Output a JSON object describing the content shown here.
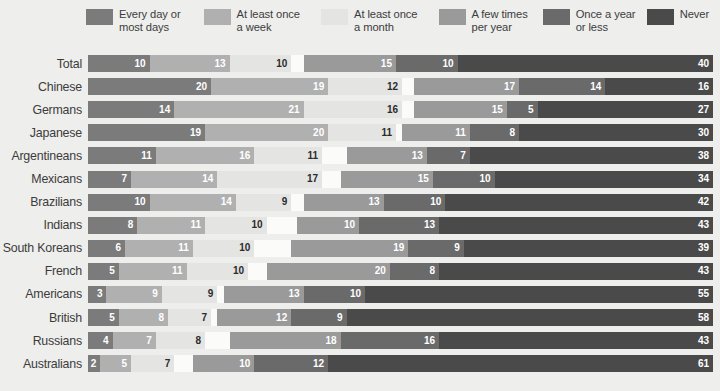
{
  "legend": {
    "items": [
      {
        "label": "Every day or\nmost days",
        "color": "#7b7b7b"
      },
      {
        "label": "At least once\na week",
        "color": "#b0b0b0"
      },
      {
        "label": "At least once\na month",
        "color": "#e4e4e2"
      },
      {
        "label": "A few times\nper year",
        "color": "#9a9a9a"
      },
      {
        "label": "Once a year\nor less",
        "color": "#6a6a6a"
      },
      {
        "label": "Never",
        "color": "#4a4a4a"
      }
    ]
  },
  "chart_data": {
    "type": "bar",
    "subtype": "stacked-horizontal-100",
    "title": "",
    "xlabel": "",
    "ylabel": "",
    "grid": false,
    "legend_position": "top",
    "xlim": [
      0,
      100
    ],
    "categories": [
      "Total",
      "Chinese",
      "Germans",
      "Japanese",
      "Argentineans",
      "Mexicans",
      "Brazilians",
      "Indians",
      "South Koreans",
      "French",
      "Americans",
      "British",
      "Russians",
      "Australians"
    ],
    "series": [
      {
        "name": "Every day or most days",
        "color": "#7b7b7b",
        "text": "light",
        "values": [
          10,
          20,
          14,
          19,
          11,
          7,
          10,
          8,
          6,
          5,
          3,
          5,
          4,
          2
        ]
      },
      {
        "name": "At least once a week",
        "color": "#b0b0b0",
        "text": "light",
        "values": [
          13,
          19,
          21,
          20,
          16,
          14,
          14,
          11,
          11,
          11,
          9,
          8,
          7,
          5
        ]
      },
      {
        "name": "At least once a month",
        "color": "#e4e4e2",
        "text": "dark",
        "values": [
          10,
          12,
          16,
          11,
          11,
          17,
          9,
          10,
          10,
          10,
          9,
          7,
          8,
          7
        ]
      },
      {
        "name": "A few times per year",
        "color": "#9a9a9a",
        "text": "light",
        "values": [
          15,
          17,
          15,
          11,
          13,
          15,
          13,
          10,
          19,
          20,
          13,
          12,
          18,
          10
        ]
      },
      {
        "name": "Once a year or less",
        "color": "#6a6a6a",
        "text": "light",
        "values": [
          10,
          14,
          5,
          8,
          7,
          10,
          10,
          13,
          9,
          8,
          10,
          9,
          16,
          12
        ]
      },
      {
        "name": "Never",
        "color": "#4a4a4a",
        "text": "light",
        "values": [
          40,
          16,
          27,
          30,
          38,
          34,
          42,
          43,
          39,
          43,
          55,
          58,
          43,
          61
        ]
      }
    ],
    "row_totals": [
      98,
      98,
      98,
      99,
      96,
      97,
      98,
      95,
      94,
      97,
      99,
      99,
      96,
      97
    ]
  },
  "colors": {
    "background": "#eeeeec",
    "gap": "#fbfbfa",
    "label_text": "#3c3c3c"
  }
}
